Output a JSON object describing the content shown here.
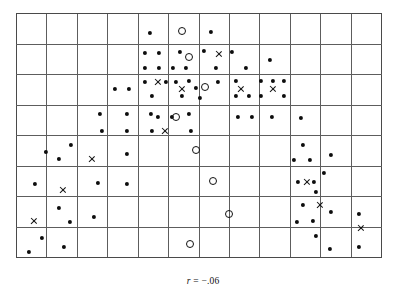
{
  "figure": {
    "title": "",
    "caption_symbol": "r",
    "caption_value": " = −.06",
    "caption_full": "r = −.06"
  },
  "chart_data": {
    "type": "scatter",
    "title": "",
    "subtitle": "",
    "xlabel": "",
    "ylabel": "",
    "annotations": [
      "r = −.06"
    ],
    "correlation": -0.06,
    "grid": {
      "visible": true,
      "columns": 12,
      "rows": 8,
      "x_left": 16,
      "x_right": 381,
      "y_top": 13,
      "y_bottom": 257,
      "cell_width": 30.42,
      "cell_height": 30.5,
      "line_color": "#5d5d5d",
      "border_color": "#4a4a4a"
    },
    "xlim": [
      0,
      12
    ],
    "ylim": [
      0,
      8
    ],
    "legend": {
      "position": "none",
      "entries": []
    },
    "marker_styles": {
      "dot": {
        "name": "filled-circle",
        "color": "#0d0d0d",
        "size": 4.2
      },
      "open": {
        "name": "open-circle",
        "color": "#111111",
        "size": 8
      },
      "cross": {
        "name": "x-cross",
        "color": "#111111",
        "size": 8
      }
    },
    "series": [
      {
        "name": "filled-dot",
        "marker": "dot",
        "points": [
          [
            150,
            33
          ],
          [
            211,
            32
          ],
          [
            145,
            53
          ],
          [
            159,
            53
          ],
          [
            180,
            52
          ],
          [
            204,
            51
          ],
          [
            232,
            52
          ],
          [
            270,
            60
          ],
          [
            145,
            68
          ],
          [
            159,
            68
          ],
          [
            173,
            68
          ],
          [
            186,
            68
          ],
          [
            216,
            68
          ],
          [
            246,
            68
          ],
          [
            145,
            82
          ],
          [
            166,
            82
          ],
          [
            176,
            82
          ],
          [
            189,
            81
          ],
          [
            196,
            88
          ],
          [
            218,
            82
          ],
          [
            152,
            96
          ],
          [
            182,
            96
          ],
          [
            200,
            98
          ],
          [
            236,
            81
          ],
          [
            249,
            96
          ],
          [
            261,
            81
          ],
          [
            273,
            81
          ],
          [
            284,
            81
          ],
          [
            236,
            96
          ],
          [
            261,
            96
          ],
          [
            284,
            96
          ],
          [
            115,
            89
          ],
          [
            129,
            89
          ],
          [
            100,
            114
          ],
          [
            102,
            131
          ],
          [
            127,
            114
          ],
          [
            151,
            114
          ],
          [
            127,
            131
          ],
          [
            152,
            131
          ],
          [
            158,
            117
          ],
          [
            172,
            117
          ],
          [
            189,
            114
          ],
          [
            191,
            131
          ],
          [
            238,
            117
          ],
          [
            252,
            117
          ],
          [
            272,
            117
          ],
          [
            301,
            118
          ],
          [
            71,
            145
          ],
          [
            59,
            159
          ],
          [
            127,
            154
          ],
          [
            303,
            145
          ],
          [
            294,
            160
          ],
          [
            310,
            160
          ],
          [
            331,
            155
          ],
          [
            46,
            152
          ],
          [
            35,
            184
          ],
          [
            98,
            183
          ],
          [
            127,
            184
          ],
          [
            298,
            182
          ],
          [
            314,
            182
          ],
          [
            324,
            173
          ],
          [
            316,
            192
          ],
          [
            59,
            208
          ],
          [
            70,
            222
          ],
          [
            94,
            217
          ],
          [
            303,
            205
          ],
          [
            297,
            222
          ],
          [
            313,
            221
          ],
          [
            331,
            212
          ],
          [
            359,
            214
          ],
          [
            42,
            238
          ],
          [
            29,
            252
          ],
          [
            64,
            247
          ],
          [
            316,
            236
          ],
          [
            330,
            249
          ],
          [
            359,
            247
          ]
        ]
      },
      {
        "name": "open-circle",
        "marker": "open",
        "points": [
          [
            182,
            31
          ],
          [
            189,
            57
          ],
          [
            205,
            87
          ],
          [
            176,
            117
          ],
          [
            196,
            150
          ],
          [
            213,
            181
          ],
          [
            229,
            214
          ],
          [
            190,
            244
          ]
        ]
      },
      {
        "name": "x-cross",
        "marker": "cross",
        "points": [
          [
            219,
            54
          ],
          [
            158,
            82
          ],
          [
            182,
            89
          ],
          [
            241,
            89
          ],
          [
            273,
            89
          ],
          [
            165,
            131
          ],
          [
            92,
            159
          ],
          [
            63,
            190
          ],
          [
            307,
            182
          ],
          [
            320,
            205
          ],
          [
            34,
            221
          ],
          [
            361,
            228
          ]
        ]
      }
    ]
  }
}
